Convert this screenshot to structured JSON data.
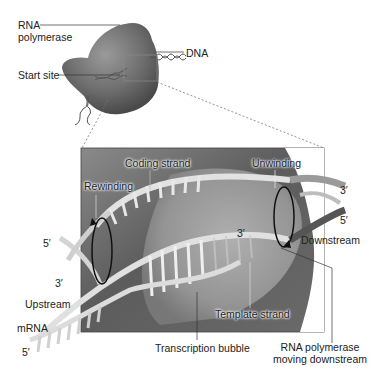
{
  "diagram": {
    "type": "transcription-elongation",
    "overview": {
      "labels": {
        "rna_polymerase_line1": "RNA",
        "rna_polymerase_line2": "polymerase",
        "dna": "DNA",
        "start_site": "Start site"
      }
    },
    "detail": {
      "labels": {
        "coding_strand": "Coding strand",
        "rewinding": "Rewinding",
        "unwinding": "Unwinding",
        "three_prime_right_top": "3′",
        "five_prime_right": "5′",
        "downstream": "Downstream",
        "five_prime_left": "5′",
        "three_prime_left": "3′",
        "three_prime_rna": "3′",
        "upstream": "Upstream",
        "mrna": "mRNA",
        "five_prime_mrna": "5′",
        "template_strand": "Template strand",
        "transcription_bubble": "Transcription bubble",
        "rna_pol_moving_line1": "RNA polymerase",
        "rna_pol_moving_line2": "moving downstream"
      }
    },
    "colors": {
      "polymerase": "#6e6e6e",
      "background_box": "#7a7a7a",
      "strand": "#d8d8d8",
      "line": "#333333"
    }
  }
}
